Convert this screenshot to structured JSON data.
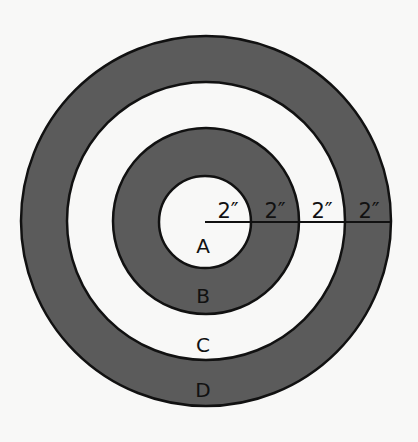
{
  "diagram": {
    "type": "concentric-target",
    "center": {
      "x": 206,
      "y": 221
    },
    "colors": {
      "dark_ring": "#5b5b5b",
      "light_ring": "#f8f8f7",
      "stroke": "#111111",
      "background": "#f8f8f7"
    },
    "rings": [
      {
        "label": "D",
        "radius": 185,
        "fill": "dark"
      },
      {
        "label": "C",
        "radius": 139,
        "fill": "light"
      },
      {
        "label": "B",
        "radius": 93,
        "fill": "dark"
      },
      {
        "label": "A",
        "radius": 46,
        "fill": "light"
      }
    ],
    "region_labels": {
      "a": "A",
      "b": "B",
      "c": "C",
      "d": "D"
    },
    "dimension_line": {
      "segments": [
        "2″",
        "2″",
        "2″",
        "2″"
      ]
    }
  }
}
